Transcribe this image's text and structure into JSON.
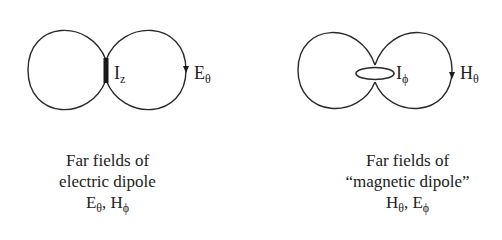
{
  "left_panel": {
    "source_label": "I",
    "source_sub": "z",
    "field_label": "E",
    "field_sub": "θ",
    "caption": {
      "line1": "Far fields of",
      "line2": "electric dipole",
      "line3_a": "E",
      "line3_a_sub": "θ",
      "line3_sep": ", ",
      "line3_b": "H",
      "line3_b_sub": "ϕ"
    }
  },
  "right_panel": {
    "source_label": "I",
    "source_sub": "ϕ",
    "field_label": "H",
    "field_sub": "θ",
    "caption": {
      "line1": "Far fields of",
      "line2": "“magnetic dipole”",
      "line3_a": "H",
      "line3_a_sub": "θ",
      "line3_sep": ", ",
      "line3_b": "E",
      "line3_b_sub": "ϕ"
    }
  },
  "colors": {
    "stroke": "#2a2a2a",
    "text": "#222222",
    "background": "#ffffff"
  }
}
